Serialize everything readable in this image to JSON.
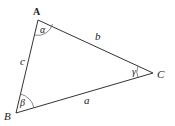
{
  "diagram": {
    "type": "triangle",
    "vertices": [
      {
        "id": "A",
        "label": "A",
        "x": 38,
        "y": 20
      },
      {
        "id": "B",
        "label": "B",
        "x": 16,
        "y": 113
      },
      {
        "id": "C",
        "label": "C",
        "x": 153,
        "y": 73
      }
    ],
    "sides": [
      {
        "id": "a",
        "label": "a",
        "between": [
          "B",
          "C"
        ]
      },
      {
        "id": "b",
        "label": "b",
        "between": [
          "A",
          "C"
        ]
      },
      {
        "id": "c",
        "label": "c",
        "between": [
          "A",
          "B"
        ]
      }
    ],
    "angles": [
      {
        "id": "alpha",
        "label": "α",
        "at": "A"
      },
      {
        "id": "beta",
        "label": "β",
        "at": "B"
      },
      {
        "id": "gamma",
        "label": "γ",
        "at": "C"
      }
    ],
    "colors": {
      "stroke": "#333333",
      "background": "#ffffff"
    }
  }
}
